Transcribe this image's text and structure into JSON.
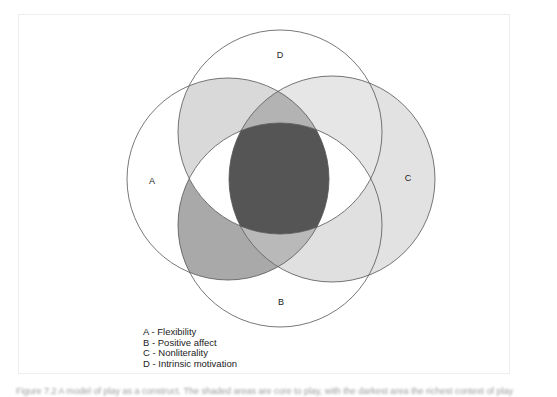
{
  "diagram": {
    "type": "venn",
    "sets": [
      {
        "id": "A",
        "label": "A",
        "name": "Flexibility"
      },
      {
        "id": "B",
        "label": "B",
        "name": "Positive affect"
      },
      {
        "id": "C",
        "label": "C",
        "name": "Nonliterality"
      },
      {
        "id": "D",
        "label": "D",
        "name": "Intrinsic motivation"
      }
    ],
    "labels": {
      "A": "A",
      "B": "B",
      "C": "C",
      "D": "D"
    },
    "legend": [
      "A - Flexibility",
      "B - Positive affect",
      "C - Nonliterality",
      "D - Intrinsic motivation"
    ],
    "colors": {
      "outline": "#555555",
      "center_all": "#555555",
      "AD": "#d9d9d9",
      "CD": "#e6e6e6",
      "C_only": "#e2e2e2",
      "AB": "#a9a9a9",
      "CB": "#e0e0e0",
      "ACD": "#b3b3b3",
      "ABC": "#b9b9b9"
    }
  },
  "caption": "Figure 7.2 A model of play as a construct. The shaded areas are core to play, with the darkest area the richest context of play"
}
